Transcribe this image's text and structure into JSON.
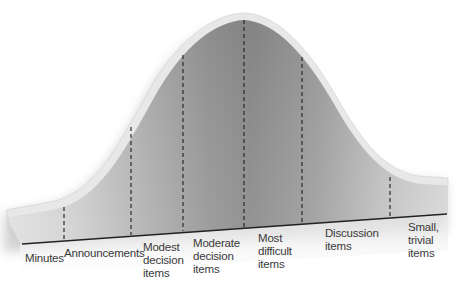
{
  "diagram": {
    "type": "bell-curve-agenda",
    "colors": {
      "background": "#ffffff",
      "band_light": "#d7d7d7",
      "band_mid": "#a9a9a9",
      "band_dark": "#8c8c8c",
      "rim": "#e4e4e4",
      "divider": "#2a2a2a",
      "baseline": "#222222",
      "text": "#3a3a3a"
    },
    "segments": [
      {
        "label": "Minutes"
      },
      {
        "label": "Announcements"
      },
      {
        "label": "Modest\ndecision\nitems"
      },
      {
        "label": "Moderate\ndecision\nitems"
      },
      {
        "label": "Most\ndifficult\nitems"
      },
      {
        "label": "Discussion\nitems"
      },
      {
        "label": "Small,\ntrivial\nitems"
      }
    ]
  }
}
